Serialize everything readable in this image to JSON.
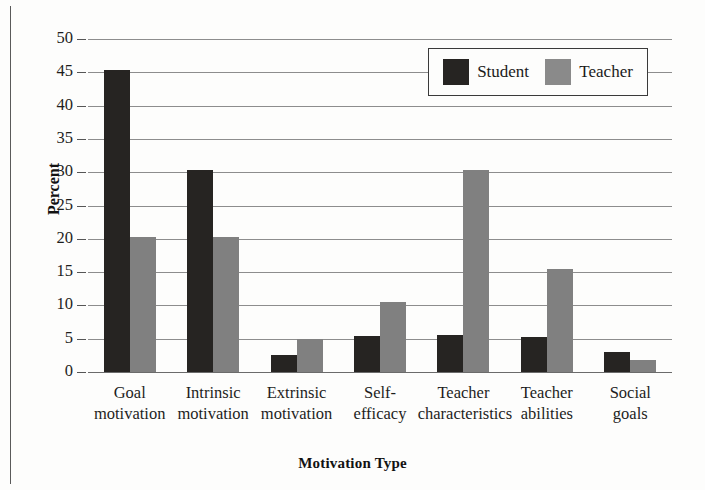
{
  "chart_data": {
    "type": "bar",
    "title": "",
    "xlabel": "Motivation Type",
    "ylabel": "Percent",
    "ylim": [
      0,
      50
    ],
    "yticks": [
      0,
      5,
      10,
      15,
      20,
      25,
      30,
      35,
      40,
      45,
      50
    ],
    "grid": true,
    "legend_position": "top-right",
    "categories": [
      "Goal motivation",
      "Intrinsic motivation",
      "Extrinsic motivation",
      "Self-efficacy",
      "Teacher characteristics",
      "Teacher abilities",
      "Social goals"
    ],
    "category_lines": [
      [
        "Goal",
        "motivation"
      ],
      [
        "Intrinsic",
        "motivation"
      ],
      [
        "Extrinsic",
        "motivation"
      ],
      [
        "Self-",
        "efficacy"
      ],
      [
        "Teacher",
        "characteristics"
      ],
      [
        "Teacher",
        "abilities"
      ],
      [
        "Social",
        "goals"
      ]
    ],
    "series": [
      {
        "name": "Student",
        "color": "#262422",
        "values": [
          45.3,
          30.3,
          2.5,
          5.4,
          5.6,
          5.2,
          3.0
        ]
      },
      {
        "name": "Teacher",
        "color": "#808080",
        "values": [
          20.2,
          20.2,
          4.9,
          10.5,
          30.3,
          15.5,
          1.8
        ]
      }
    ]
  },
  "legend": {
    "entries": [
      {
        "label": "Student",
        "swatch": "dark-swatch-icon"
      },
      {
        "label": "Teacher",
        "swatch": "gray-swatch-icon"
      }
    ]
  },
  "axes": {
    "y_title": "Percent",
    "x_title": "Motivation Type",
    "y_tick_labels": [
      "50",
      "45",
      "40",
      "35",
      "30",
      "25",
      "20",
      "15",
      "10",
      "5",
      "0"
    ]
  }
}
